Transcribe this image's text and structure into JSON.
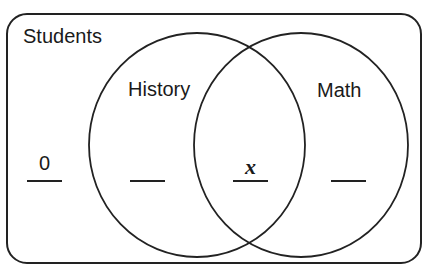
{
  "diagram": {
    "type": "venn",
    "universe_label": "Students",
    "sets": [
      {
        "label": "History"
      },
      {
        "label": "Math"
      }
    ],
    "regions": {
      "outside": "0",
      "history_only": "",
      "both": "x",
      "math_only": ""
    },
    "stroke_color": "#222222"
  }
}
